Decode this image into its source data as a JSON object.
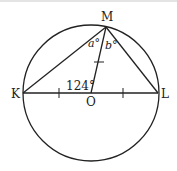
{
  "diagram": {
    "points": {
      "K": {
        "label": "K",
        "x": 23,
        "y": 93
      },
      "L": {
        "label": "L",
        "x": 158,
        "y": 93
      },
      "M": {
        "label": "M",
        "x": 106,
        "y": 26
      },
      "O": {
        "label": "O",
        "x": 91,
        "y": 93
      }
    },
    "circle": {
      "cx": 91,
      "cy": 93,
      "r": 68
    },
    "angles": {
      "KOM": "124°",
      "a": "a°",
      "b": "b°"
    },
    "colors": {
      "stroke": "#222222",
      "background": "#ffffff"
    }
  }
}
